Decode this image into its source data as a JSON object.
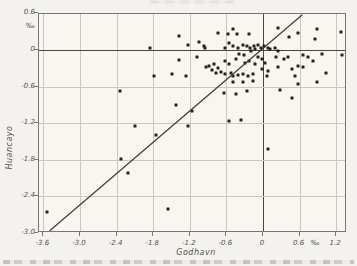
{
  "figure": {
    "background": "#f3f2ee",
    "dot_color": "#25231e",
    "grid_color": "#cbc8bd",
    "axis_color": "#7a766b",
    "zero_line_color": "#49463e",
    "text_color": "#56534a",
    "line_color": "#3e3c35"
  },
  "chart_data": {
    "type": "scatter",
    "title": "",
    "xlabel": "Godhavn",
    "ylabel": "Huancayo",
    "unit_label": "‰",
    "xlim": [
      -3.67,
      1.38
    ],
    "ylim": [
      -3.0,
      0.6
    ],
    "grid": true,
    "grid_step": 0.6,
    "zero_axes_emphasized": true,
    "x_unit_pos": 0.87,
    "y_unit_pos": 0.38,
    "x_ticks": [
      {
        "v": -3.6,
        "label": "-3.6"
      },
      {
        "v": -3.0,
        "label": "-3.0"
      },
      {
        "v": -2.4,
        "label": "-2.4"
      },
      {
        "v": -1.8,
        "label": "-1.8"
      },
      {
        "v": -1.2,
        "label": "-1.2"
      },
      {
        "v": -0.6,
        "label": "-0.6"
      },
      {
        "v": 0,
        "label": "0"
      },
      {
        "v": 0.6,
        "label": "0.6"
      },
      {
        "v": 1.2,
        "label": "1.2"
      }
    ],
    "y_ticks": [
      {
        "v": 0.6,
        "label": "0.6"
      },
      {
        "v": 0,
        "label": "0"
      },
      {
        "v": -0.6,
        "label": "-0.6"
      },
      {
        "v": -1.2,
        "label": "-1.2"
      },
      {
        "v": -1.8,
        "label": "-1.8"
      },
      {
        "v": -2.4,
        "label": "-2.4"
      },
      {
        "v": -3.0,
        "label": "-3.0"
      }
    ],
    "regression_line": {
      "x1": -3.48,
      "y1": -2.98,
      "x2": 0.66,
      "y2": 0.56,
      "slope": 0.86,
      "intercept": 0
    },
    "points": [
      [
        -3.54,
        -2.65
      ],
      [
        -2.34,
        -0.67
      ],
      [
        -2.32,
        -1.79
      ],
      [
        -2.22,
        -2.01
      ],
      [
        -2.1,
        -1.24
      ],
      [
        -1.85,
        0.03
      ],
      [
        -1.79,
        -0.42
      ],
      [
        -1.75,
        -1.4
      ],
      [
        -1.55,
        -2.6
      ],
      [
        -1.5,
        -0.39
      ],
      [
        -1.42,
        -0.9
      ],
      [
        -1.38,
        -0.16
      ],
      [
        -1.37,
        0.23
      ],
      [
        -1.26,
        -0.42
      ],
      [
        -1.23,
        0.08
      ],
      [
        -1.23,
        -1.24
      ],
      [
        -1.16,
        -1.0
      ],
      [
        -1.08,
        -0.12
      ],
      [
        -1.05,
        0.13
      ],
      [
        -0.96,
        0.07
      ],
      [
        -0.95,
        0.04
      ],
      [
        -0.93,
        -0.28
      ],
      [
        -0.88,
        -0.26
      ],
      [
        -0.84,
        -0.32
      ],
      [
        -0.8,
        -0.23
      ],
      [
        -0.77,
        -0.37
      ],
      [
        -0.74,
        0.28
      ],
      [
        -0.74,
        -0.3
      ],
      [
        -0.69,
        -0.36
      ],
      [
        -0.64,
        -0.7
      ],
      [
        -0.63,
        -0.18
      ],
      [
        -0.63,
        -0.39
      ],
      [
        -0.62,
        0.04
      ],
      [
        -0.58,
        0.26
      ],
      [
        -0.55,
        0.11
      ],
      [
        -0.55,
        -0.23
      ],
      [
        -0.55,
        -1.17
      ],
      [
        -0.52,
        -0.37
      ],
      [
        -0.5,
        -0.42
      ],
      [
        -0.5,
        -0.53
      ],
      [
        -0.49,
        0.34
      ],
      [
        -0.49,
        0.07
      ],
      [
        -0.45,
        -0.72
      ],
      [
        -0.44,
        -0.15
      ],
      [
        -0.43,
        0.26
      ],
      [
        -0.41,
        0.04
      ],
      [
        -0.41,
        -0.41
      ],
      [
        -0.39,
        -0.07
      ],
      [
        -0.36,
        -1.14
      ],
      [
        -0.33,
        0.08
      ],
      [
        -0.33,
        -0.39
      ],
      [
        -0.33,
        -0.53
      ],
      [
        -0.31,
        -0.09
      ],
      [
        -0.3,
        -0.22
      ],
      [
        -0.27,
        0.07
      ],
      [
        -0.27,
        -0.67
      ],
      [
        -0.25,
        -0.42
      ],
      [
        -0.23,
        0.26
      ],
      [
        -0.23,
        -0.18
      ],
      [
        -0.22,
        0.04
      ],
      [
        -0.2,
        -0.02
      ],
      [
        -0.17,
        -0.39
      ],
      [
        -0.17,
        -0.5
      ],
      [
        -0.14,
        0.06
      ],
      [
        -0.13,
        0.01
      ],
      [
        -0.13,
        -0.23
      ],
      [
        -0.09,
        0.08
      ],
      [
        -0.08,
        -0.11
      ],
      [
        -0.03,
        0.04
      ],
      [
        -0.01,
        -0.15
      ],
      [
        -0.01,
        -0.31
      ],
      [
        0.02,
        0.07
      ],
      [
        0.03,
        -0.22
      ],
      [
        0.06,
        -0.42
      ],
      [
        0.08,
        0.04
      ],
      [
        0.08,
        -0.34
      ],
      [
        0.08,
        -1.63
      ],
      [
        0.11,
        0.02
      ],
      [
        0.2,
        0.04
      ],
      [
        0.22,
        -0.12
      ],
      [
        0.25,
        0.36
      ],
      [
        0.25,
        -0.02
      ],
      [
        0.25,
        -0.28
      ],
      [
        0.28,
        -0.65
      ],
      [
        0.35,
        -0.15
      ],
      [
        0.41,
        -0.11
      ],
      [
        0.43,
        0.21
      ],
      [
        0.47,
        -0.31
      ],
      [
        0.47,
        -0.79
      ],
      [
        0.52,
        -0.42
      ],
      [
        0.57,
        0.28
      ],
      [
        0.58,
        -0.26
      ],
      [
        0.58,
        -0.56
      ],
      [
        0.66,
        -0.09
      ],
      [
        0.66,
        -0.28
      ],
      [
        0.73,
        -0.12
      ],
      [
        0.82,
        -0.18
      ],
      [
        0.85,
        0.18
      ],
      [
        0.88,
        0.34
      ],
      [
        0.88,
        -0.53
      ],
      [
        0.96,
        -0.07
      ],
      [
        1.04,
        -0.37
      ],
      [
        1.28,
        0.29
      ],
      [
        1.29,
        -0.09
      ]
    ]
  }
}
